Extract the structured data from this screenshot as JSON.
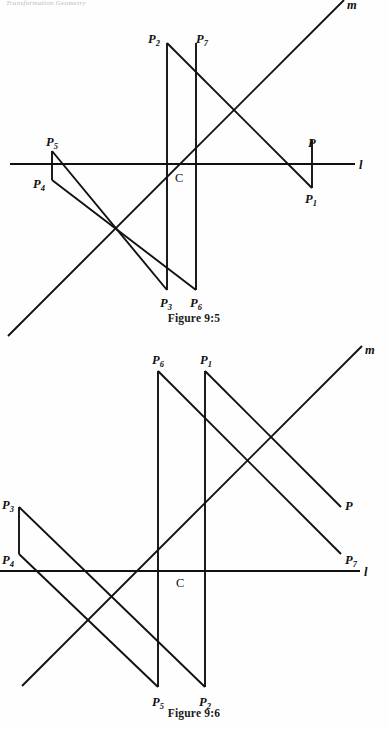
{
  "page": {
    "running_head": "Transformation Geometry",
    "background": "#ffffff",
    "ink": "#111111"
  },
  "figures": [
    {
      "id": "figure-1",
      "caption": "Figure 9:5",
      "axis_labels": {
        "line_l": "l",
        "line_m": "m",
        "center": "C"
      },
      "points": [
        {
          "name": "P",
          "base": "P",
          "sub": "",
          "x": 312,
          "y": 143
        },
        {
          "name": "P1",
          "base": "P",
          "sub": "1",
          "x": 312,
          "y": 196
        },
        {
          "name": "P2",
          "base": "P",
          "sub": "2",
          "x": 155,
          "y": 38
        },
        {
          "name": "P3",
          "base": "P",
          "sub": "3",
          "x": 167,
          "y": 302
        },
        {
          "name": "P4",
          "base": "P",
          "sub": "4",
          "x": 40,
          "y": 183
        },
        {
          "name": "P5",
          "base": "P",
          "sub": "5",
          "x": 54,
          "y": 142
        },
        {
          "name": "P6",
          "base": "P",
          "sub": "6",
          "x": 196,
          "y": 302
        },
        {
          "name": "P7",
          "base": "P",
          "sub": "7",
          "x": 200,
          "y": 38
        }
      ],
      "segments": [
        {
          "from": "P2",
          "to": "P1",
          "kind": "diagonal"
        },
        {
          "from": "P7",
          "to": "P6",
          "kind": "vertical"
        },
        {
          "from": "P2",
          "to": "P3",
          "kind": "vertical"
        },
        {
          "from": "P5",
          "to": "P3",
          "kind": "diagonal"
        },
        {
          "from": "P4",
          "to": "P6",
          "kind": "diagonal"
        },
        {
          "from": "P5",
          "to": "P4",
          "kind": "vertical"
        },
        {
          "from": "P",
          "to": "P1",
          "kind": "vertical"
        }
      ]
    },
    {
      "id": "figure-2",
      "caption": "Figure 9:6",
      "axis_labels": {
        "line_l": "l",
        "line_m": "m",
        "center": "C"
      },
      "points": [
        {
          "name": "P",
          "base": "P",
          "sub": "",
          "x": 345,
          "y": 505
        },
        {
          "name": "P1",
          "base": "P",
          "sub": "1",
          "x": 205,
          "y": 356
        },
        {
          "name": "P2",
          "base": "P",
          "sub": "2",
          "x": 205,
          "y": 690
        },
        {
          "name": "P3",
          "base": "P",
          "sub": "3",
          "x": 10,
          "y": 505
        },
        {
          "name": "P4",
          "base": "P",
          "sub": "4",
          "x": 10,
          "y": 553
        },
        {
          "name": "P5",
          "base": "P",
          "sub": "5",
          "x": 158,
          "y": 690
        },
        {
          "name": "P6",
          "base": "P",
          "sub": "6",
          "x": 158,
          "y": 356
        },
        {
          "name": "P7",
          "base": "P",
          "sub": "7",
          "x": 345,
          "y": 555
        }
      ],
      "segments": [
        {
          "from": "P6",
          "to": "P5",
          "kind": "vertical"
        },
        {
          "from": "P1",
          "to": "P2",
          "kind": "vertical"
        },
        {
          "from": "P6",
          "to": "P7",
          "kind": "diagonal"
        },
        {
          "from": "P1",
          "to": "P",
          "kind": "diagonal"
        },
        {
          "from": "P3",
          "to": "P2",
          "kind": "diagonal"
        },
        {
          "from": "P4",
          "to": "P5",
          "kind": "diagonal"
        },
        {
          "from": "P3",
          "to": "P4",
          "kind": "vertical"
        }
      ]
    }
  ]
}
